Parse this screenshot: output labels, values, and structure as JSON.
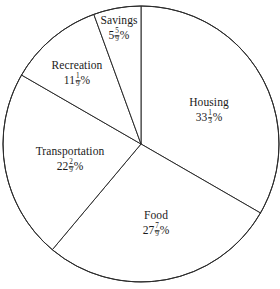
{
  "chart_data": {
    "type": "pie",
    "title": "",
    "subtitle": "",
    "xlabel": "",
    "ylabel": "",
    "legend_position": "none",
    "grid": false,
    "total_percent": 100,
    "start_angle_deg": 0,
    "direction": "clockwise",
    "categories": [
      "Housing",
      "Food",
      "Transportation",
      "Recreation",
      "Savings"
    ],
    "values": [
      33.3333,
      27.7778,
      22.2222,
      11.1111,
      5.5556
    ],
    "slices": [
      {
        "label": "Housing",
        "value_text": "33",
        "fraction_numerator": "1",
        "fraction_denominator": "3",
        "percent_sign": "%",
        "value": 33.3333,
        "angle_deg": 120,
        "start_deg": 0,
        "end_deg": 120,
        "label_x": 209,
        "label_y": 111
      },
      {
        "label": "Food",
        "value_text": "27",
        "fraction_numerator": "7",
        "fraction_denominator": "9",
        "percent_sign": "%",
        "value": 27.7778,
        "angle_deg": 100,
        "start_deg": 120,
        "end_deg": 220,
        "label_x": 156,
        "label_y": 224
      },
      {
        "label": "Transportation",
        "value_text": "22",
        "fraction_numerator": "2",
        "fraction_denominator": "9",
        "percent_sign": "%",
        "value": 22.2222,
        "angle_deg": 80,
        "start_deg": 220,
        "end_deg": 300,
        "label_x": 70,
        "label_y": 160
      },
      {
        "label": "Recreation",
        "value_text": "11",
        "fraction_numerator": "1",
        "fraction_denominator": "9",
        "percent_sign": "%",
        "value": 11.1111,
        "angle_deg": 40,
        "start_deg": 300,
        "end_deg": 340,
        "label_x": 77,
        "label_y": 74
      },
      {
        "label": "Savings",
        "value_text": "5",
        "fraction_numerator": "5",
        "fraction_denominator": "9",
        "percent_sign": "%",
        "value": 5.5556,
        "angle_deg": 20,
        "start_deg": 340,
        "end_deg": 360,
        "label_x": 119,
        "label_y": 29
      }
    ],
    "geometry": {
      "center_x": 141,
      "center_y": 144,
      "radius": 138
    },
    "colors": {
      "slice_fill": "#ffffff",
      "slice_stroke": "#2b2b2b",
      "text": "#1a1a1a",
      "background": "#ffffff"
    }
  }
}
